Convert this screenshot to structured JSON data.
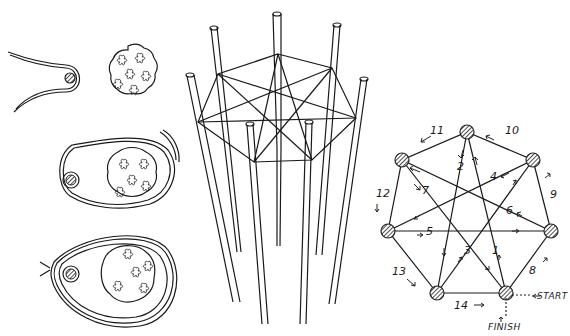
{
  "figure": {
    "panels": [
      {
        "id": "bead-wrapping-steps",
        "description": "Three steps of wrapping a cord loop around a bead and a cluster of flowers"
      },
      {
        "id": "pole-frame",
        "description": "Eight poles with a heptagonal star lacing across the top"
      },
      {
        "id": "lacing-order-diagram",
        "description": "Heptagon of seven hatched nodes with numbered lacing order"
      }
    ],
    "lacing": {
      "steps": [
        {
          "n": "1",
          "x": 492,
          "y": 254
        },
        {
          "n": "2",
          "x": 461,
          "y": 170
        },
        {
          "n": "3",
          "x": 467,
          "y": 254
        },
        {
          "n": "4",
          "x": 494,
          "y": 180
        },
        {
          "n": "5",
          "x": 430,
          "y": 235
        },
        {
          "n": "6",
          "x": 510,
          "y": 214
        },
        {
          "n": "7",
          "x": 425,
          "y": 194
        },
        {
          "n": "8",
          "x": 531,
          "y": 272
        },
        {
          "n": "9",
          "x": 551,
          "y": 197
        },
        {
          "n": "10",
          "x": 507,
          "y": 131
        },
        {
          "n": "11",
          "x": 429,
          "y": 131
        },
        {
          "n": "12",
          "x": 378,
          "y": 195
        },
        {
          "n": "13",
          "x": 388,
          "y": 275
        },
        {
          "n": "14",
          "x": 449,
          "y": 309
        }
      ],
      "start_label": "START",
      "finish_label": "FINISH"
    }
  }
}
